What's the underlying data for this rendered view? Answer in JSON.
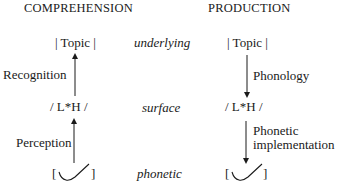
{
  "headers": {
    "left": "COMPREHENSION",
    "right": "PRODUCTION"
  },
  "levels": {
    "underlying": "underlying",
    "surface": "surface",
    "phonetic": "phonetic"
  },
  "comprehension": {
    "top": "| Topic |",
    "middle": "/ L*H /",
    "bottom_open": "[",
    "bottom_close": "]",
    "arrow_upper_label": "Recognition",
    "arrow_lower_label": "Perception"
  },
  "production": {
    "top": "| Topic |",
    "middle": "/ L*H /",
    "bottom_open": "[",
    "bottom_close": "]",
    "arrow_upper_label": "Phonology",
    "arrow_lower_label_line1": "Phonetic",
    "arrow_lower_label_line2": "implementation"
  },
  "colors": {
    "text": "#1a1a1a",
    "line": "#1a1a1a",
    "background": "#ffffff"
  }
}
